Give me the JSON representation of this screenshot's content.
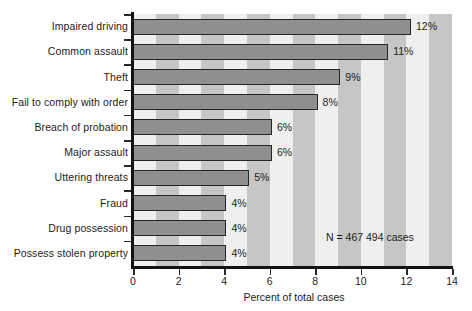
{
  "chart_data": {
    "type": "bar",
    "orientation": "horizontal",
    "title": "",
    "subtitle": "",
    "xlabel": "Percent of total cases",
    "ylabel": "",
    "xlim": [
      0,
      14
    ],
    "xticks": [
      0,
      2,
      4,
      6,
      8,
      10,
      12,
      14
    ],
    "xtick_labels": [
      "0",
      "2",
      "4",
      "6",
      "8",
      "10",
      "12",
      "14"
    ],
    "grid": false,
    "background_bands": true,
    "legend": null,
    "categories": [
      "Impaired driving",
      "Common assault",
      "Theft",
      "Fail to comply with order",
      "Breach of probation",
      "Major assault",
      "Uttering threats",
      "Fraud",
      "Drug possession",
      "Possess stolen property"
    ],
    "values": [
      12.2,
      11.2,
      9.1,
      8.1,
      6.1,
      6.1,
      5.1,
      4.1,
      4.1,
      4.1
    ],
    "data_labels": [
      "12%",
      "11%",
      "9%",
      "8%",
      "6%",
      "6%",
      "5%",
      "4%",
      "4%",
      "4%"
    ],
    "annotations": [
      {
        "text": "N = 467 494 cases",
        "x": 9.5,
        "y": 8.6
      }
    ],
    "colors": {
      "bar_fill": "#8f8f8f",
      "bar_edge": "#262626",
      "band_dark": "#c6c6c6",
      "band_light": "#efefef",
      "axis": "#121212",
      "text": "#1c1c1c",
      "page_background": "#ffffff"
    }
  }
}
